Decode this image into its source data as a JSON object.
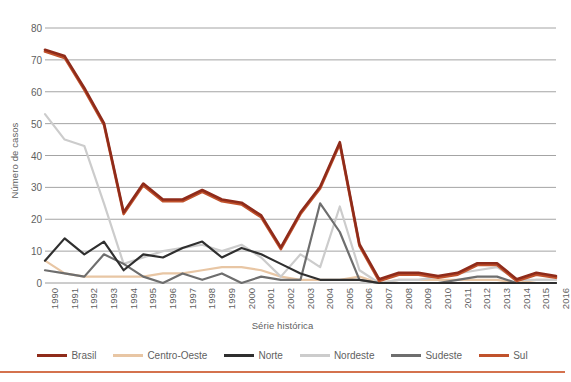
{
  "axis": {
    "ylabel": "Número de casos",
    "xlabel": "Série histórica",
    "yticks": [
      "0",
      "10",
      "20",
      "30",
      "40",
      "50",
      "60",
      "70",
      "80"
    ]
  },
  "legend": [
    {
      "label": "Brasil",
      "color": "#8f2b1a"
    },
    {
      "label": "Centro-Oeste",
      "color": "#e8c6a4"
    },
    {
      "label": "Norte",
      "color": "#2f2f2f"
    },
    {
      "label": "Nordeste",
      "color": "#cccccc"
    },
    {
      "label": "Sudeste",
      "color": "#6e6e6e"
    },
    {
      "label": "Sul",
      "color": "#c0522c"
    }
  ],
  "chart_data": {
    "type": "line",
    "title": "",
    "xlabel": "Série histórica",
    "ylabel": "Número de casos",
    "ylim": [
      0,
      80
    ],
    "grid": true,
    "legend_position": "bottom",
    "x": [
      "1990",
      "1991",
      "1992",
      "1993",
      "1994",
      "1995",
      "1996",
      "1997",
      "1998",
      "1999",
      "2000",
      "2001",
      "2002",
      "2003",
      "2004",
      "2005",
      "2006",
      "2007",
      "2008",
      "2009",
      "2010",
      "2011",
      "2012",
      "2013",
      "2014",
      "2015",
      "2016"
    ],
    "series": [
      {
        "name": "Brasil",
        "color": "#8f2b1a",
        "values": [
          73,
          71,
          61,
          50,
          22,
          31,
          26,
          26,
          29,
          26,
          25,
          21,
          11,
          22,
          30,
          44,
          12,
          1,
          3,
          3,
          2,
          3,
          6,
          6,
          1,
          3,
          2
        ]
      },
      {
        "name": "Centro-Oeste",
        "color": "#e8c6a4",
        "values": [
          7,
          3,
          2,
          2,
          2,
          2,
          3,
          3,
          4,
          5,
          5,
          4,
          2,
          1,
          1,
          1,
          2,
          0,
          1,
          1,
          1,
          1,
          1,
          1,
          0,
          1,
          1
        ]
      },
      {
        "name": "Norte",
        "color": "#2f2f2f",
        "values": [
          7,
          14,
          9,
          13,
          4,
          9,
          8,
          11,
          13,
          8,
          11,
          9,
          6,
          3,
          1,
          1,
          1,
          0,
          0,
          0,
          0,
          0,
          0,
          0,
          0,
          0,
          0
        ]
      },
      {
        "name": "Nordeste",
        "color": "#cccccc",
        "values": [
          53,
          45,
          43,
          25,
          6,
          8,
          10,
          11,
          12,
          10,
          12,
          8,
          2,
          9,
          5,
          24,
          4,
          0,
          1,
          1,
          2,
          3,
          4,
          5,
          1,
          1,
          1
        ]
      },
      {
        "name": "Sudeste",
        "color": "#6e6e6e",
        "values": [
          4,
          3,
          2,
          9,
          6,
          2,
          0,
          3,
          1,
          3,
          0,
          2,
          1,
          1,
          25,
          16,
          1,
          0,
          0,
          0,
          0,
          1,
          2,
          2,
          0,
          0,
          0
        ]
      },
      {
        "name": "Sul",
        "color": "#c0522c",
        "values": [
          73,
          71,
          61,
          50,
          22,
          31,
          26,
          26,
          29,
          26,
          25,
          21,
          11,
          22,
          30,
          44,
          12,
          1,
          3,
          3,
          2,
          3,
          6,
          6,
          1,
          3,
          2
        ]
      }
    ]
  }
}
